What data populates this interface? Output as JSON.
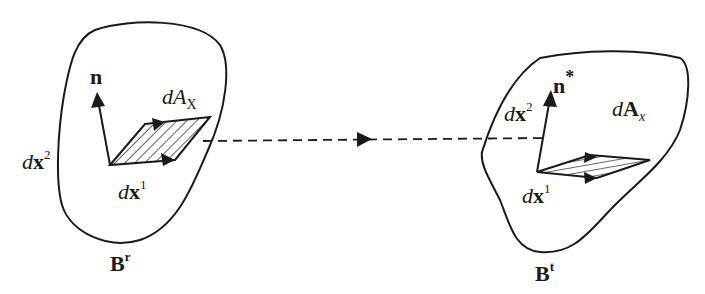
{
  "diagram": {
    "type": "continuum-mechanics-area-mapping",
    "colors": {
      "stroke": "#1a1a1a",
      "background": "#ffffff"
    },
    "left_body": {
      "name_base": "B",
      "name_sup": "r",
      "normal_label": "n",
      "area_label_d": "d",
      "area_label_A": "A",
      "area_label_sub": "X",
      "vec1_d": "d",
      "vec1_x": "x",
      "vec1_sup": "1",
      "vec2_d": "d",
      "vec2_x": "x",
      "vec2_sup": "2"
    },
    "right_body": {
      "name_base": "B",
      "name_sup": "t",
      "normal_label": "n",
      "normal_star": "*",
      "area_label_d": "d",
      "area_label_A": "A",
      "area_label_sub": "x",
      "vec1_d": "d",
      "vec1_x": "x",
      "vec1_sup": "1",
      "vec2_d": "d",
      "vec2_x": "x",
      "vec2_sup": "2"
    },
    "mapping_arrow": {
      "style": "dashed",
      "direction": "left-to-right"
    }
  }
}
